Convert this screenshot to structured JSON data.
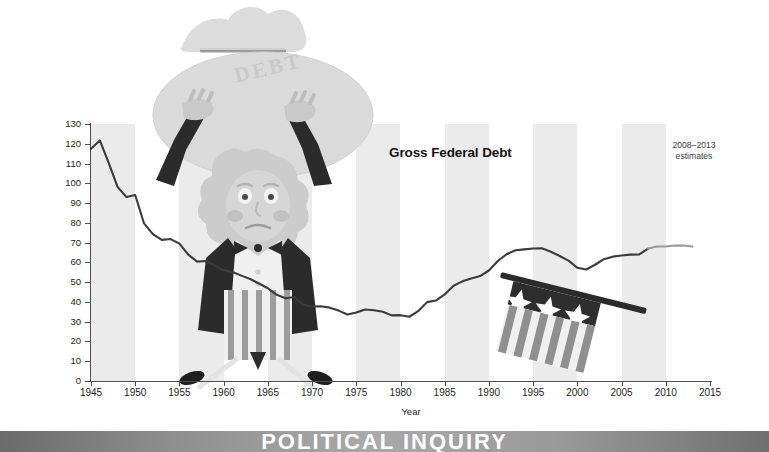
{
  "figure": {
    "series_title": "Gross Federal Debt",
    "annotation": "2008–2013\nestimates",
    "annotation_line1": "2008–2013",
    "annotation_line2": "estimates",
    "illustration_word": "DEBT",
    "banner_text": "POLITICAL INQUIRY",
    "colors": {
      "line": "#3b3b3b",
      "band": "#ebebeb",
      "axis": "#4d4d4d",
      "text": "#231f20",
      "illustration_light": "#d9d9d9",
      "illustration_mid": "#bfbfbf",
      "illustration_dark": "#2b2b2b",
      "banner_text": "#ffffff"
    }
  },
  "chart_data": {
    "type": "line",
    "title": "Gross Federal Debt",
    "xlabel": "Year",
    "ylabel": "Percentage of GDP",
    "xlim": [
      1945,
      2015
    ],
    "ylim": [
      0,
      130
    ],
    "grid": false,
    "legend": "none",
    "y_ticks": [
      0,
      10,
      20,
      30,
      40,
      50,
      60,
      70,
      80,
      90,
      100,
      110,
      120,
      130
    ],
    "x_ticks": [
      1945,
      1950,
      1955,
      1960,
      1965,
      1970,
      1975,
      1980,
      1985,
      1990,
      1995,
      2000,
      2005,
      2010,
      2015
    ],
    "annotations": [
      {
        "text": "Gross Federal Debt",
        "x": 1978,
        "y": 103
      },
      {
        "text": "2008–2013 estimates",
        "x": 2009,
        "y": 106
      }
    ],
    "estimate_range": [
      2008,
      2013
    ],
    "series": [
      {
        "name": "Gross Federal Debt",
        "unit": "Percentage of GDP",
        "x": [
          1945,
          1946,
          1947,
          1948,
          1949,
          1950,
          1951,
          1952,
          1953,
          1954,
          1955,
          1956,
          1957,
          1958,
          1959,
          1960,
          1961,
          1962,
          1963,
          1964,
          1965,
          1966,
          1967,
          1968,
          1969,
          1970,
          1971,
          1972,
          1973,
          1974,
          1975,
          1976,
          1977,
          1978,
          1979,
          1980,
          1981,
          1982,
          1983,
          1984,
          1985,
          1986,
          1987,
          1988,
          1989,
          1990,
          1991,
          1992,
          1993,
          1994,
          1995,
          1996,
          1997,
          1998,
          1999,
          2000,
          2001,
          2002,
          2003,
          2004,
          2005,
          2006,
          2007,
          2008,
          2009,
          2010,
          2011,
          2012,
          2013
        ],
        "y": [
          117.5,
          121.7,
          110.3,
          98.2,
          93.1,
          94.1,
          79.7,
          74.3,
          71.4,
          71.8,
          69.5,
          63.9,
          60.4,
          60.7,
          58.5,
          56.0,
          55.1,
          53.3,
          51.6,
          49.3,
          46.9,
          43.6,
          41.9,
          42.5,
          38.6,
          37.6,
          37.8,
          37.1,
          35.6,
          33.6,
          34.7,
          36.2,
          35.8,
          35.0,
          33.2,
          33.3,
          32.5,
          35.3,
          39.9,
          40.7,
          43.8,
          48.2,
          50.4,
          51.9,
          53.1,
          55.9,
          60.7,
          64.1,
          66.1,
          66.6,
          67.0,
          67.1,
          65.4,
          63.2,
          60.9,
          57.3,
          56.4,
          58.8,
          61.6,
          62.9,
          63.5,
          63.9,
          64.0,
          67.0,
          68.0,
          68.0,
          68.5,
          68.5,
          68.0
        ]
      }
    ]
  }
}
